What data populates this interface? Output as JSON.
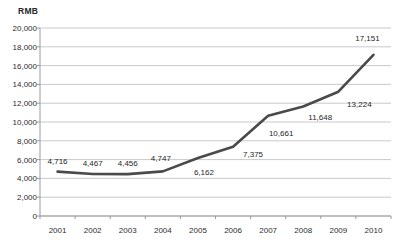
{
  "chart_data": {
    "type": "line",
    "title": "",
    "subtitle": "",
    "xlabel": "",
    "ylabel": "RMB",
    "categories": [
      "2001",
      "2002",
      "2003",
      "2004",
      "2005",
      "2006",
      "2007",
      "2008",
      "2009",
      "2010"
    ],
    "values": [
      4716,
      4467,
      4456,
      4747,
      6162,
      7375,
      10661,
      11648,
      13224,
      17151
    ],
    "data_labels": [
      "4,716",
      "4,467",
      "4,456",
      "4,747",
      "6,162",
      "7,375",
      "10,661",
      "11,648",
      "13,224",
      "17,151"
    ],
    "ylim": [
      0,
      20000
    ],
    "ytick_values": [
      0,
      2000,
      4000,
      6000,
      8000,
      10000,
      12000,
      14000,
      16000,
      18000,
      20000
    ],
    "ytick_labels": [
      "0",
      "2,000",
      "4,000",
      "6,000",
      "8,000",
      "10,000",
      "12,000",
      "14,000",
      "16,000",
      "18,000",
      "20,000"
    ],
    "grid": true,
    "grid_axis": "y",
    "legend": false,
    "legend_position": "none",
    "series": [
      {
        "name": "RMB",
        "values": [
          4716,
          4467,
          4456,
          4747,
          6162,
          7375,
          10661,
          11648,
          13224,
          17151
        ],
        "color": "#4a4a4a",
        "line_width": 2.6,
        "markers": false
      }
    ],
    "colors": {
      "line": "#4a4a4a",
      "grid": "#c9c9c9",
      "axis": "#9a9a9a",
      "text": "#2d2d2d",
      "background": "#ffffff"
    }
  },
  "label_offsets": [
    {
      "dx": 0,
      "dy": -11
    },
    {
      "dx": 0,
      "dy": -11
    },
    {
      "dx": 0,
      "dy": -11
    },
    {
      "dx": -2,
      "dy": -13
    },
    {
      "dx": 6,
      "dy": 14
    },
    {
      "dx": 20,
      "dy": 7
    },
    {
      "dx": 13,
      "dy": 17
    },
    {
      "dx": 17,
      "dy": 10
    },
    {
      "dx": 21,
      "dy": 12
    },
    {
      "dx": -6,
      "dy": -17
    }
  ]
}
